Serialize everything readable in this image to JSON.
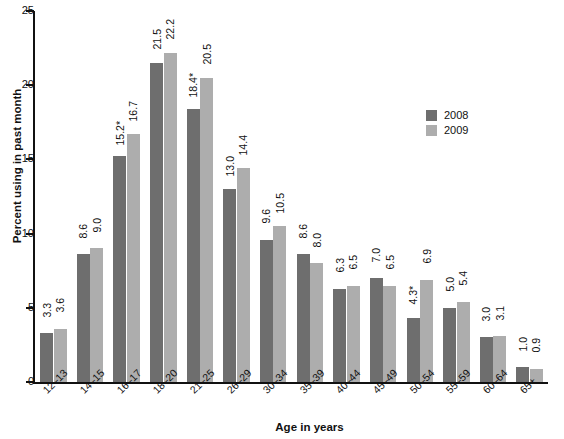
{
  "chart_data": {
    "type": "bar",
    "title": "",
    "xlabel": "Age in years",
    "ylabel": "Percent using in past month",
    "ylim": [
      0,
      25
    ],
    "yticks": [
      0,
      5,
      10,
      15,
      20,
      25
    ],
    "ytick_labels": [
      "0",
      "5",
      "10",
      "15",
      "20",
      "25"
    ],
    "grid": false,
    "legend_position": "upper right",
    "categories": [
      "12–13",
      "14–15",
      "16–17",
      "18–20",
      "21–25",
      "26–29",
      "30–34",
      "35–39",
      "40–44",
      "45–49",
      "50–54",
      "55–59",
      "60–64",
      "65+"
    ],
    "series": [
      {
        "name": "2008",
        "color": "#6e6e6e",
        "values": [
          3.3,
          8.6,
          15.2,
          21.5,
          18.4,
          13.0,
          9.6,
          8.6,
          6.3,
          7.0,
          4.3,
          5.0,
          3.0,
          1.0
        ],
        "labels": [
          "3.3",
          "8.6",
          "15.2*",
          "21.5",
          "18.4*",
          "13.0",
          "9.6",
          "8.6",
          "6.3",
          "7.0",
          "4.3*",
          "5.0",
          "3.0",
          "1.0"
        ]
      },
      {
        "name": "2009",
        "color": "#adadad",
        "values": [
          3.6,
          9.0,
          16.7,
          22.2,
          20.5,
          14.4,
          10.5,
          8.0,
          6.5,
          6.5,
          6.9,
          5.4,
          3.1,
          0.9
        ],
        "labels": [
          "3.6",
          "9.0",
          "16.7",
          "22.2",
          "20.5",
          "14.4",
          "10.5",
          "8.0",
          "6.5",
          "6.5",
          "6.9",
          "5.4",
          "3.1",
          "0.9"
        ]
      }
    ]
  },
  "legend": {
    "items": [
      {
        "label": "2008",
        "color": "#6e6e6e"
      },
      {
        "label": "2009",
        "color": "#adadad"
      }
    ]
  },
  "axes": {
    "y_title": "Percent using in past month",
    "x_title": "Age in years"
  }
}
